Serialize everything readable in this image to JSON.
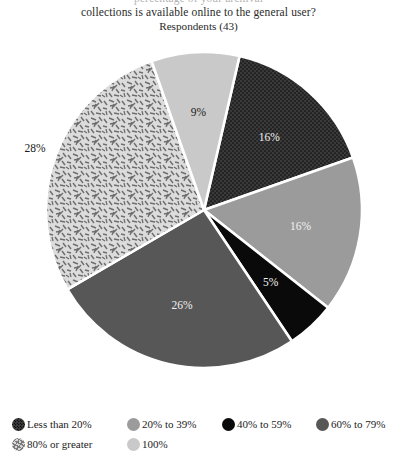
{
  "title": {
    "line_cut_off": "percentage of your archival",
    "line_1": "collections is available online to the general user?",
    "subtitle": "Respondents (43)"
  },
  "chart_data": {
    "type": "pie",
    "title": "collections is available online to the general user?",
    "subtitle": "Respondents (43)",
    "respondents": 43,
    "unit": "percent",
    "start_angle_deg": -77,
    "direction": "clockwise",
    "categories": [
      "Less than 20%",
      "20% to 39%",
      "40% to 59%",
      "60% to 79%",
      "80% or greater",
      "100%"
    ],
    "values": [
      16,
      16,
      5,
      26,
      28,
      9
    ],
    "labels": [
      "16%",
      "16%",
      "5%",
      "26%",
      "28%",
      "9%"
    ],
    "label_placement": [
      "inside",
      "inside",
      "inside",
      "inside",
      "outside-left",
      "inside"
    ],
    "label_color": [
      "light",
      "light",
      "light",
      "light",
      "dark",
      "dark"
    ],
    "colors": [
      "#3a3a3a",
      "#9b9b9b",
      "#0a0a0a",
      "#575757",
      "#d8d8d8",
      "#c9c9c9"
    ],
    "patterns": [
      "dots",
      "solid",
      "solid",
      "solid",
      "dashes",
      "solid"
    ],
    "legend_position": "bottom",
    "grid": false
  },
  "legend": {
    "rows": [
      [
        {
          "label": "Less than 20%",
          "color": "#3a3a3a",
          "pattern": "dots"
        },
        {
          "label": "20% to 39%",
          "color": "#9b9b9b",
          "pattern": "solid"
        },
        {
          "label": "40% to 59%",
          "color": "#0a0a0a",
          "pattern": "solid"
        },
        {
          "label": "60% to 79%",
          "color": "#575757",
          "pattern": "solid"
        }
      ],
      [
        {
          "label": "80% or greater",
          "color": "#d8d8d8",
          "pattern": "dashes"
        },
        {
          "label": "100%",
          "color": "#c9c9c9",
          "pattern": "solid"
        }
      ]
    ]
  }
}
